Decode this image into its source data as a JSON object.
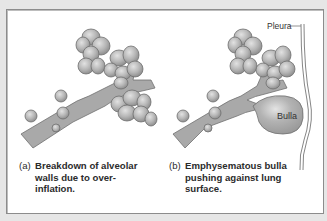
{
  "figure": {
    "panels": [
      {
        "id": "a",
        "label": "(a)",
        "caption_lines": [
          "Breakdown of alveolar",
          "walls due to over-",
          "inflation."
        ]
      },
      {
        "id": "b",
        "label": "(b)",
        "caption_lines": [
          "Emphysematous bulla",
          "pushing against lung",
          "surface."
        ],
        "annotations": {
          "pleura": "Pleura",
          "bulla": "Bulla"
        }
      }
    ],
    "colors": {
      "background": "#e6e6e6",
      "panel": "#ffffff",
      "tissue": "#a8a8a8",
      "tissue_outline": "#6e6e6e",
      "alveoli": "#b9b9b9",
      "text": "#2b2b2b"
    }
  }
}
